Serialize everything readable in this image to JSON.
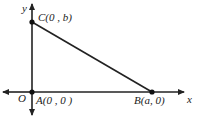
{
  "diagram": {
    "type": "coordinate-triangle",
    "axes": {
      "x_label": "x",
      "y_label": "y",
      "origin_label": "O"
    },
    "points": [
      {
        "id": "C",
        "label": "C(0 , b)",
        "coords": [
          0,
          "b"
        ]
      },
      {
        "id": "A",
        "label": "A(0 , 0 )",
        "coords": [
          0,
          0
        ]
      },
      {
        "id": "B",
        "label": "B(a, 0)",
        "coords": [
          "a",
          0
        ]
      }
    ],
    "segments": [
      [
        "C",
        "B"
      ],
      [
        "C",
        "A"
      ],
      [
        "A",
        "B"
      ]
    ],
    "colors": {
      "line": "#222222",
      "background": "#ffffff"
    }
  }
}
